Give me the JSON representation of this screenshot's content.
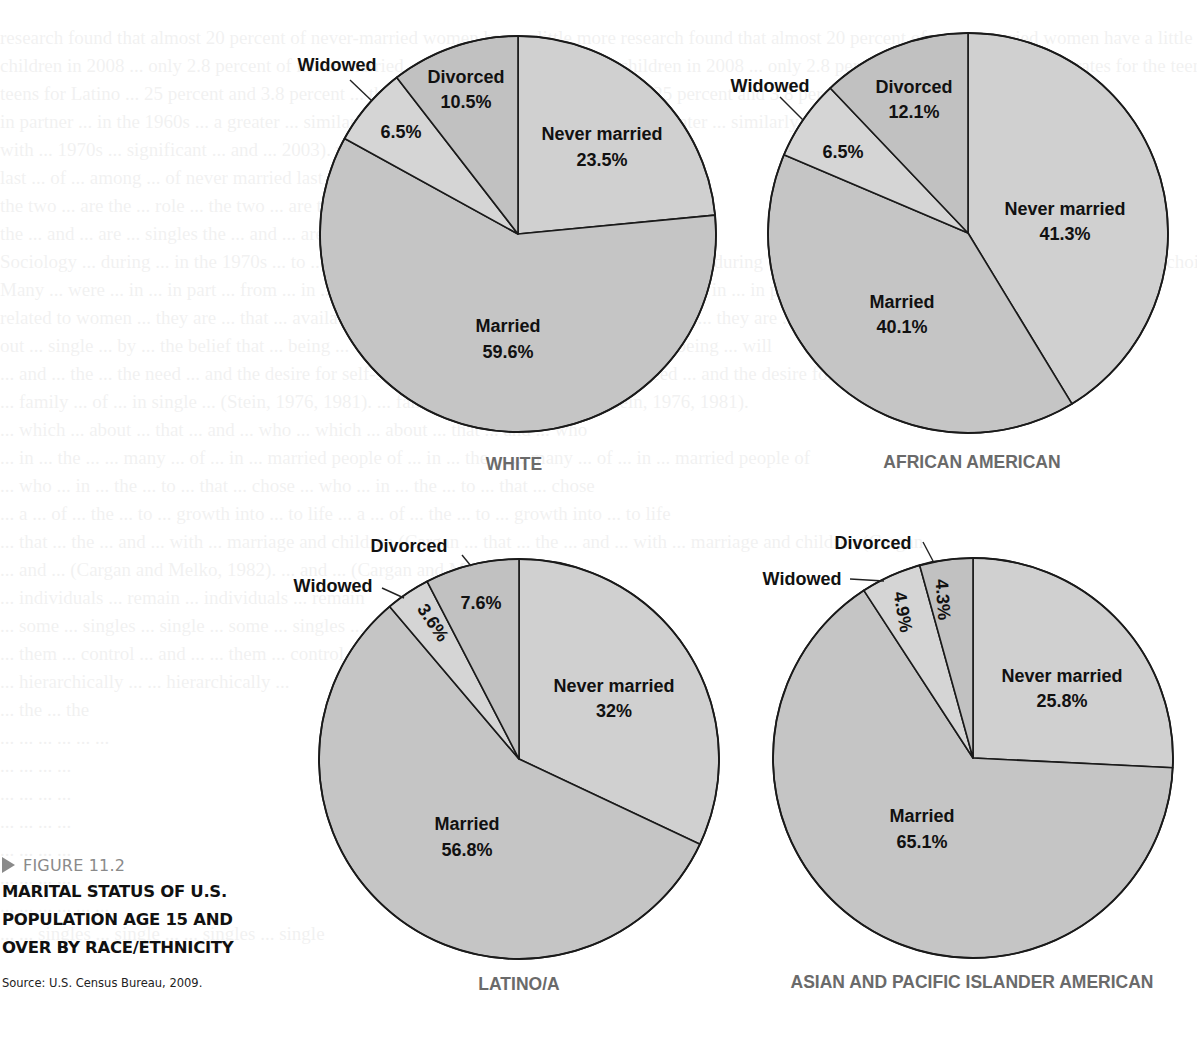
{
  "figure": {
    "label": "FIGURE 11.2",
    "title_lines": [
      "MARITAL STATUS OF U.S.",
      "POPULATION AGE 15 AND",
      "OVER BY RACE/ETHNICITY"
    ],
    "source": "Source: U.S. Census Bureau, 2009."
  },
  "colors": {
    "never_married": "#d0d0d0",
    "married": "#c5c5c5",
    "widowed": "#d5d5d5",
    "divorced": "#c1c1c1",
    "outline": "#1a1a1a",
    "pie_title": "#6a6a6a",
    "figure_label": "#8a8a8a"
  },
  "chart_data": [
    {
      "type": "pie",
      "title": "WHITE",
      "start_angle": "12 o'clock, clockwise",
      "categories": [
        "Never married",
        "Married",
        "Widowed",
        "Divorced"
      ],
      "values": [
        23.5,
        59.6,
        6.5,
        10.5
      ],
      "labels": [
        "23.5%",
        "59.6%",
        "6.5%",
        "10.5%"
      ]
    },
    {
      "type": "pie",
      "title": "AFRICAN AMERICAN",
      "start_angle": "12 o'clock, clockwise",
      "categories": [
        "Never married",
        "Married",
        "Widowed",
        "Divorced"
      ],
      "values": [
        41.3,
        40.1,
        6.5,
        12.1
      ],
      "labels": [
        "41.3%",
        "40.1%",
        "6.5%",
        "12.1%"
      ]
    },
    {
      "type": "pie",
      "title": "LATINO/A",
      "start_angle": "12 o'clock, clockwise",
      "categories": [
        "Never married",
        "Married",
        "Widowed",
        "Divorced"
      ],
      "values": [
        32,
        56.8,
        3.6,
        7.6
      ],
      "labels": [
        "32%",
        "56.8%",
        "3.6%",
        "7.6%"
      ]
    },
    {
      "type": "pie",
      "title": "ASIAN AND PACIFIC ISLANDER AMERICAN",
      "start_angle": "12 o'clock, clockwise",
      "categories": [
        "Never married",
        "Married",
        "Widowed",
        "Divorced"
      ],
      "values": [
        25.8,
        65.1,
        4.9,
        4.3
      ],
      "labels": [
        "25.8%",
        "65.1%",
        "4.9%",
        "4.3%"
      ]
    }
  ],
  "ghost_text": [
    "research found that almost 20 percent of never-married women have a little more",
    "children in 2008 ... only 2.8 percent of never-married ... the rates for the teen and",
    "teens for Latino ... 25 percent and 3.8 percent ... through increased",
    "in partner ... in the 1960s ... a greater ... similarly. In the",
    "with ... 1970s ... significant ... and ... 2003).",
    "last ... of ... among ... of never married",
    "the two ... are the ... role ...",
    "the ... and ... are ... singles",
    "Sociology ... during ... in the 1970s ... to ... in major cultural ... single by choice.",
    "Many ... were ... in ... in part ... from ... in ... because they were ... especially",
    "related to women ... they are ... that ... availability of sexual partners with",
    "out ... single ... by ... the belief that ... being ... will",
    "... and ... the ... the need ... and the desire for self-sufficiency and",
    "... family ... of ... in single ... (Stein, 1976, 1981).",
    "... which ... about ... that ... and ... who",
    "... in ... the ... ... many ... of ... in ... married people of",
    "... who ... in ... the ... to ... that ... chose",
    "... a ... of ... the ... to ... growth into ... to life",
    "... that ... the ... and ... with ... marriage and children (Cargan",
    "... and ... (Cargan and Melko, 1982).",
    "... individuals ... remain",
    "... some ... singles ... single",
    "... them ... control ... and ...",
    "... hierarchically ... ",
    "... the",
    "... ... ...",
    "... ...",
    "... ...",
    "... ...",
    "... ...",
    "... ...",
    "... ... ...",
    "... ... singles ... single"
  ]
}
